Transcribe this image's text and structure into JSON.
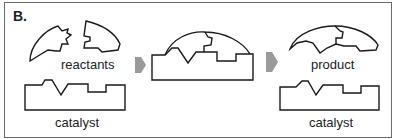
{
  "panel_label": "B.",
  "labels": {
    "reactants": "reactants",
    "catalyst_left": "catalyst",
    "product": "product",
    "catalyst_right": "catalyst"
  },
  "colors": {
    "stroke": "#1a1a1a",
    "arrow": "#9a9a9a",
    "frame": "#6a6a6a"
  },
  "stages": [
    {
      "name": "reactants + catalyst"
    },
    {
      "name": "enzyme-substrate complex"
    },
    {
      "name": "product + catalyst"
    }
  ]
}
